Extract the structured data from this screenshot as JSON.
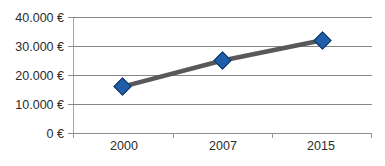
{
  "chart_data": {
    "type": "line",
    "title": "",
    "subtitle": "",
    "xlabel": "",
    "ylabel": "",
    "categories": [
      "2000",
      "2007",
      "2015"
    ],
    "values": [
      16000,
      25000,
      32000
    ],
    "series": [
      {
        "name": "",
        "values": [
          16000,
          25000,
          32000
        ]
      }
    ],
    "ytick_labels": [
      "40.000 €",
      "30.000 €",
      "20.000 €",
      "10.000 €",
      "0 €"
    ],
    "ytick_values": [
      40000,
      30000,
      20000,
      10000,
      0
    ],
    "ylim": [
      0,
      40000
    ],
    "grid": true,
    "legend": "none",
    "currency_symbol": "€",
    "line_color": "#595959",
    "marker_color": "#1f5fa9",
    "marker_border_color": "#12365f",
    "marker_shape": "diamond",
    "gridline_color": "#868686",
    "axis_color": "#a6a6a6",
    "background_color": "#ffffff",
    "text_color": "#2b2b2b"
  }
}
